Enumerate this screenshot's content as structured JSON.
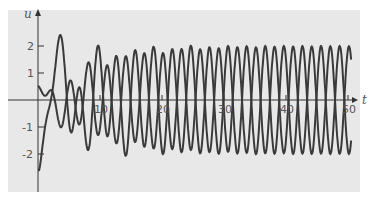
{
  "chart_data": {
    "type": "line",
    "title": "",
    "xlabel": "t",
    "ylabel": "u",
    "xlim": [
      0,
      52
    ],
    "ylim": [
      -2.8,
      2.8
    ],
    "x_ticks": [
      10,
      20,
      30,
      40,
      50
    ],
    "x_tick_labels": [
      "10",
      "20",
      "30",
      "40",
      "50"
    ],
    "y_ticks": [
      -2,
      -1,
      1,
      2
    ],
    "y_tick_labels": [
      "-2",
      "-1",
      "1",
      "2"
    ],
    "grid": false,
    "legend": null,
    "series": [
      {
        "name": "response A",
        "description": "transient oscillation settling to steady periodic amplitude ~2",
        "u0": -2.3,
        "steady_amplitude": 2.0,
        "period": 3.0
      },
      {
        "name": "response B",
        "description": "small initial oscillation (amplitude ~0.4-0.6) growing to steady amplitude ~2",
        "u0": 0.4,
        "steady_amplitude": 2.0,
        "period": 3.0
      }
    ],
    "colors": {
      "background": "#e8e8e8",
      "line": "#3a3a3a",
      "axis": "#333333"
    }
  }
}
